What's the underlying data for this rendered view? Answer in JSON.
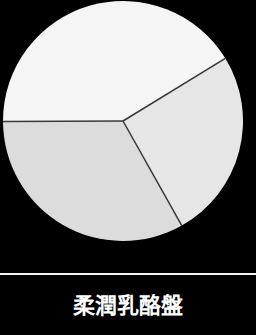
{
  "chart_data": {
    "type": "pie",
    "title": "柔潤乳酪盤",
    "start_angle_deg": 58.5,
    "direction": "clockwise",
    "slices": [
      {
        "label": "",
        "value": 25.6,
        "color": "#e6e6e6"
      },
      {
        "label": "",
        "value": 33.1,
        "color": "#dcdcdc"
      },
      {
        "label": "",
        "value": 41.3,
        "color": "#f5f5f5"
      }
    ],
    "slice_border_color": "#3a3a3a",
    "background": "#000000",
    "legend": "none"
  },
  "caption": {
    "text": "柔潤乳酪盤"
  }
}
